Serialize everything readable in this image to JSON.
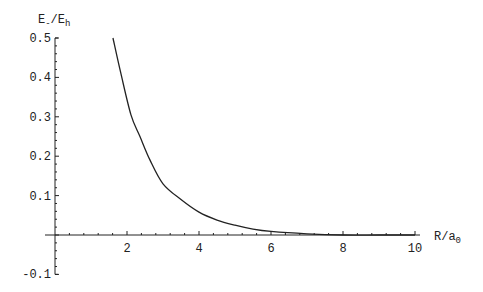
{
  "chart_data": {
    "type": "line",
    "title": "",
    "xlabel": "R/a0",
    "ylabel": "E-/Eh",
    "xlabel_parts": {
      "main": "R/a",
      "sub": "0"
    },
    "ylabel_parts": {
      "main1": "E",
      "sub1": "-",
      "sep": "/E",
      "sub2": "h"
    },
    "xlim": [
      0,
      10
    ],
    "ylim": [
      -0.1,
      0.5
    ],
    "x_ticks": [
      2,
      4,
      6,
      8,
      10
    ],
    "x_tick_labels": [
      "2",
      "4",
      "6",
      "8",
      "10"
    ],
    "y_ticks": [
      -0.1,
      0.1,
      0.2,
      0.3,
      0.4,
      0.5
    ],
    "y_tick_labels": [
      "-0.1",
      "0.1",
      "0.2",
      "0.3",
      "0.4",
      "0.5"
    ],
    "grid": false,
    "legend": null,
    "series": [
      {
        "name": "E-/Eh",
        "x": [
          1.61,
          1.83,
          2.11,
          2.36,
          2.64,
          3.0,
          3.5,
          4.0,
          4.5,
          5.0,
          5.5,
          6.0,
          7.0,
          8.0,
          9.0,
          10.0
        ],
        "y": [
          0.5,
          0.41,
          0.305,
          0.25,
          0.19,
          0.13,
          0.09,
          0.058,
          0.038,
          0.025,
          0.015,
          0.009,
          0.003,
          0.0,
          0.0,
          0.0
        ]
      }
    ]
  },
  "layout": {
    "origin_px": [
      55,
      235
    ],
    "px_per_x": 36,
    "px_per_y": 394
  }
}
